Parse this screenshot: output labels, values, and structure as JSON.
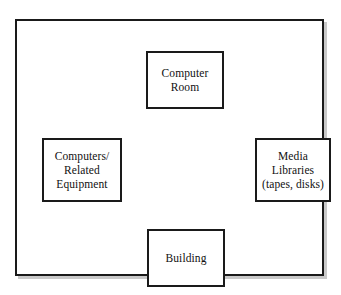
{
  "diagram": {
    "type": "block-diagram",
    "background_color": "#ffffff",
    "border_color": "#1a1a1a",
    "shadow_color": "#c9c9c9",
    "frame": {
      "name": "outer-container-frame",
      "label": ""
    },
    "nodes": [
      {
        "id": "computer-room",
        "label": "Computer\nRoom",
        "position": "top"
      },
      {
        "id": "computers-related-equipment",
        "label": "Computers/\nRelated\nEquipment",
        "position": "left"
      },
      {
        "id": "media-libraries",
        "label": "Media\nLibraries\n(tapes, disks)",
        "position": "right"
      },
      {
        "id": "building",
        "label": "Building",
        "position": "bottom"
      }
    ]
  }
}
